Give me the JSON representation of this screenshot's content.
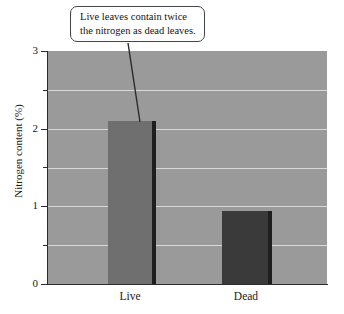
{
  "chart_data": {
    "type": "bar",
    "title": "",
    "subtitle": "",
    "xlabel": "",
    "ylabel": "Nitrogen content (%)",
    "categories": [
      "Live",
      "Dead"
    ],
    "values": [
      2.1,
      0.94
    ],
    "series": [
      {
        "name": "Nitrogen content",
        "values": [
          2.1,
          0.94
        ]
      }
    ],
    "ylim": [
      0,
      3
    ],
    "y_ticks_major": [
      "0",
      "1",
      "2",
      "3"
    ],
    "y_ticks_major_values": [
      0,
      1,
      2,
      3
    ],
    "y_ticks_minor_values": [
      0.5,
      1.5,
      2.5
    ],
    "gridlines": [
      0.5,
      1,
      1.5,
      2,
      2.5
    ],
    "grid": true,
    "legend": "none",
    "annotations": [
      {
        "text_line_1": "Live leaves contain twice",
        "text_line_2": "the nitrogen as dead leaves.",
        "points_to": "Live"
      }
    ],
    "bar_colors": [
      "#6e6f6e",
      "#3a3a3a"
    ],
    "plot_background": "#999a99",
    "gridline_color": "#d8d8d8",
    "axis_color": "#2b2b2b"
  },
  "axis": {
    "y_title": "Nitrogen content (%)",
    "tick_labels": {
      "t3": "3",
      "t2": "2",
      "t1": "1",
      "t0": "0"
    },
    "x_labels": {
      "live": "Live",
      "dead": "Dead"
    }
  },
  "callout": {
    "line_1": "Live leaves contain twice",
    "line_2": "the nitrogen as dead leaves."
  }
}
